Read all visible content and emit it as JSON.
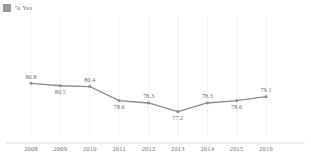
{
  "legend": {
    "swatch_color": "#9a9a9a",
    "label": "% Yes"
  },
  "chart_data": {
    "type": "line",
    "title": "",
    "subtitle": "",
    "xlabel": "",
    "ylabel": "",
    "categories": [
      "2008",
      "2009",
      "2010",
      "2011",
      "2012",
      "2013",
      "2014",
      "2015",
      "2016"
    ],
    "series": [
      {
        "name": "% Yes",
        "color": "#8c8c8c",
        "values": [
          80.8,
          80.5,
          80.4,
          78.6,
          78.3,
          77.2,
          78.3,
          78.6,
          79.1
        ]
      }
    ],
    "point_labels": [
      "80.8",
      "80.5",
      "80.4",
      "78.6",
      "78.3",
      "77.2",
      "78.3",
      "78.6",
      "79.1"
    ],
    "point_label_positions": [
      "above",
      "below",
      "above",
      "below",
      "above",
      "below",
      "above",
      "below",
      "above"
    ],
    "ylim": [
      76.0,
      82.0
    ],
    "grid": "vertical-only",
    "y_axis_visible": false,
    "x_axis_visible": true,
    "legend_position": "top-left",
    "marker": "square"
  }
}
